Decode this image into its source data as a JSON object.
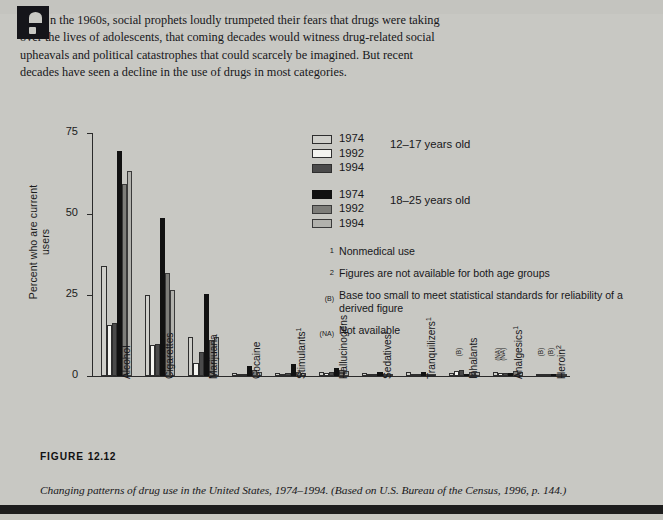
{
  "intro": {
    "dropcap": "I",
    "paragraph": "n the 1960s, social prophets loudly trumpeted their fears that drugs were taking over the lives of adolescents, that coming decades would witness drug-related social upheavals and political catastrophes that could scarcely be imagined. But recent decades have seen a decline in the use of drugs in most categories."
  },
  "figure": {
    "tag_label": "FIGURE",
    "tag_number": "12.12",
    "caption": "Changing patterns of drug use in the United States, 1974–1994. (Based on U.S. Bureau of the Census, 1996, p. 144.)"
  },
  "legend": {
    "groups": [
      {
        "age": "12–17 years old",
        "entries": [
          {
            "year": "1974",
            "swatch": "b74y"
          },
          {
            "year": "1992",
            "swatch": "b92y"
          },
          {
            "year": "1994",
            "swatch": "b94y"
          }
        ]
      },
      {
        "age": "18–25 years old",
        "entries": [
          {
            "year": "1974",
            "swatch": "b74o"
          },
          {
            "year": "1992",
            "swatch": "b92o"
          },
          {
            "year": "1994",
            "swatch": "b94o"
          }
        ]
      }
    ]
  },
  "notes": [
    {
      "marker": "1",
      "marker_style": "sup",
      "text": "Nonmedical use"
    },
    {
      "marker": "2",
      "marker_style": "sup",
      "text": "Figures are not available for both age groups"
    },
    {
      "marker": "(B)",
      "marker_style": "small",
      "text": "Base too small to meet statistical standards for reliability of a derived figure"
    },
    {
      "marker": "(NA)",
      "marker_style": "small",
      "text": "Not available"
    }
  ],
  "chart_data": {
    "type": "bar",
    "title": "",
    "xlabel": "",
    "ylabel": "Percent who are current users",
    "ylim": [
      0,
      75
    ],
    "yticks": [
      0,
      25,
      50,
      75
    ],
    "ytick_labels": [
      "0",
      "25",
      "50",
      "75"
    ],
    "grid": false,
    "legend_position": "upper right",
    "categories": [
      "Alcohol",
      "Cigarettes",
      "Marijuana",
      "Cocaine",
      "Stimulants¹",
      "Hallucinogens",
      "Sedatives¹",
      "Tranquilizers¹",
      "Inhalants",
      "Analgesics¹",
      "Heroin²"
    ],
    "series": [
      {
        "name": "1974 (12–17 years old)",
        "key": "b74y",
        "values": [
          34.0,
          25.0,
          12.0,
          1.0,
          1.0,
          1.3,
          1.0,
          1.2,
          0.9,
          1.1,
          0.3
        ]
      },
      {
        "name": "1992 (12–17 years old)",
        "key": "b92y",
        "values": [
          15.7,
          9.6,
          4.0,
          0.3,
          0.6,
          0.9,
          0.2,
          0.2,
          1.4,
          0.8,
          0.1
        ]
      },
      {
        "name": "1994 (12–17 years old)",
        "key": "b94y",
        "values": [
          16.3,
          9.8,
          7.3,
          0.3,
          0.8,
          1.1,
          0.2,
          0.3,
          2.0,
          1.0,
          0.1
        ]
      },
      {
        "name": "1974 (18–25 years old)",
        "key": "b74o",
        "values": [
          69.3,
          48.8,
          25.2,
          3.1,
          3.7,
          2.5,
          1.3,
          1.2,
          0.7,
          0.8,
          0.4
        ]
      },
      {
        "name": "1992 (18–25 years old)",
        "key": "b92o",
        "values": [
          59.2,
          31.9,
          11.0,
          1.8,
          1.1,
          1.9,
          0.5,
          0.7,
          1.1,
          1.6,
          0.2
        ]
      },
      {
        "name": "1994 (18–25 years old)",
        "key": "b94o",
        "values": [
          63.4,
          26.6,
          12.1,
          1.2,
          0.9,
          1.4,
          0.4,
          0.5,
          1.2,
          1.3,
          0.2
        ]
      }
    ],
    "annotations": [
      {
        "category": "Inhalants",
        "text": "(B)"
      },
      {
        "category": "Analgesics¹",
        "text": "(NA)"
      },
      {
        "category": "Analgesics¹",
        "text": "(NA)"
      },
      {
        "category": "Heroin²",
        "text": "(B)"
      },
      {
        "category": "Heroin²",
        "text": "(B)"
      }
    ]
  }
}
